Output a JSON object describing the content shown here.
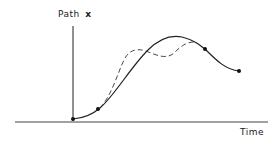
{
  "diagram": {
    "y_axis_label": "Path",
    "y_axis_variable": "x",
    "x_axis_label": "Time",
    "colors": {
      "line": "#222222",
      "background": "#ffffff"
    },
    "curves": [
      {
        "name": "solid-path",
        "style": "solid",
        "points": [
          [
            73,
            119
          ],
          [
            98,
            109
          ],
          [
            125,
            80
          ],
          [
            150,
            48
          ],
          [
            178,
            37
          ],
          [
            205,
            49
          ],
          [
            225,
            66
          ],
          [
            239,
            71
          ]
        ]
      },
      {
        "name": "dashed-path",
        "style": "dashed",
        "points": [
          [
            104,
            104
          ],
          [
            118,
            78
          ],
          [
            128,
            56
          ],
          [
            136,
            50
          ],
          [
            152,
            54
          ],
          [
            168,
            57
          ],
          [
            182,
            45
          ],
          [
            192,
            42
          ]
        ]
      }
    ],
    "markers": [
      [
        73,
        119
      ],
      [
        98,
        109
      ],
      [
        205,
        49
      ],
      [
        239,
        71
      ]
    ]
  }
}
